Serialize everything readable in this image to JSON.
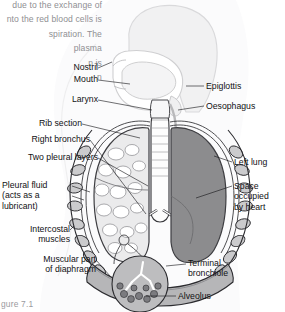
{
  "figure": {
    "caption": "gure 7.1",
    "body_text": "due to the exchange of\nnto the red blood cells is\nspiration. The\nplasma\nn is\nn"
  },
  "colors": {
    "page_background": "#ffffff",
    "body_silhouette": "#f2f2f3",
    "silhouette_outline": "#d8d8da",
    "left_lung_fill": "#8b8b8c",
    "right_lung_fill": "#e9e9ea",
    "rib_fill": "#c9c9cb",
    "pleura_fill": "#ffffff",
    "trachea_fill": "#fdfdfd",
    "diaphragm_fill": "#b4b4b6",
    "inset_fill": "#bcbcbe",
    "label_text": "#111114",
    "body_text": "#8f8f93",
    "leader_line": "#16161a"
  },
  "labels": {
    "left": [
      {
        "id": "nostril",
        "text": "Nostril"
      },
      {
        "id": "mouth",
        "text": "Mouth"
      },
      {
        "id": "larynx",
        "text": "Larynx"
      },
      {
        "id": "rib-section",
        "text": "Rib section"
      },
      {
        "id": "right-bronchus",
        "text": "Right bronchus"
      },
      {
        "id": "two-pleural-layers",
        "text": "Two pleural layers"
      },
      {
        "id": "pleural-fluid",
        "text": "Pleural fluid\n(acts as a\nlubricant)"
      },
      {
        "id": "intercostal-muscles",
        "text": "Intercostal\nmuscles"
      },
      {
        "id": "muscular-part-of-diaphragm",
        "text": "Muscular part\nof diaphragm"
      }
    ],
    "right": [
      {
        "id": "epiglottis",
        "text": "Epiglottis"
      },
      {
        "id": "oesophagus",
        "text": "Oesophagus"
      },
      {
        "id": "left-lung",
        "text": "Left lung"
      },
      {
        "id": "space-occupied-by-heart",
        "text": "Space\noccupied\nby heart"
      },
      {
        "id": "terminal-bronchiole",
        "text": "Terminal\nbronchiole"
      },
      {
        "id": "alveolus",
        "text": "Alveolus"
      }
    ]
  }
}
